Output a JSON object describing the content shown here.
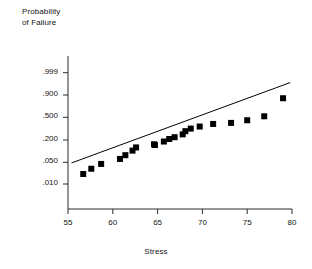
{
  "chart": {
    "type": "scatter",
    "title": "",
    "ylabel": "Probability\nof Failure",
    "xlabel": "Stress"
  },
  "chart_data": {
    "type": "scatter",
    "title": "",
    "xlabel": "Stress",
    "ylabel": "Probability of Failure",
    "y_scale": "probability",
    "grid": false,
    "legend": null,
    "xlim": [
      55,
      80
    ],
    "xticks": [
      55,
      60,
      65,
      70,
      75,
      80
    ],
    "xtick_labels": [
      "55",
      "60",
      "65",
      "70",
      "75",
      "80"
    ],
    "yticks": [
      0.01,
      0.05,
      0.2,
      0.5,
      0.9,
      0.999
    ],
    "ytick_labels": [
      ".010",
      ".050",
      ".200",
      ".500",
      ".900",
      ".999"
    ],
    "ylim": [
      0.004,
      0.9995
    ],
    "series": [
      {
        "name": "observations",
        "marker": "square",
        "color": "#000000",
        "points": [
          {
            "x": 56.7,
            "y": 0.011
          },
          {
            "x": 57.6,
            "y": 0.021
          },
          {
            "x": 58.7,
            "y": 0.036
          },
          {
            "x": 60.8,
            "y": 0.06
          },
          {
            "x": 61.4,
            "y": 0.085
          },
          {
            "x": 62.2,
            "y": 0.125
          },
          {
            "x": 62.6,
            "y": 0.16
          },
          {
            "x": 64.6,
            "y": 0.2
          },
          {
            "x": 64.7,
            "y": 0.19
          },
          {
            "x": 65.7,
            "y": 0.24
          },
          {
            "x": 66.3,
            "y": 0.28
          },
          {
            "x": 66.9,
            "y": 0.31
          },
          {
            "x": 67.8,
            "y": 0.36
          },
          {
            "x": 68.1,
            "y": 0.42
          },
          {
            "x": 68.7,
            "y": 0.47
          },
          {
            "x": 69.7,
            "y": 0.51
          },
          {
            "x": 71.2,
            "y": 0.56
          },
          {
            "x": 73.2,
            "y": 0.58
          },
          {
            "x": 75.0,
            "y": 0.63
          },
          {
            "x": 76.9,
            "y": 0.7
          },
          {
            "x": 79.0,
            "y": 0.92
          }
        ]
      },
      {
        "name": "fit-line",
        "type": "line",
        "color": "#000000",
        "endpoints": [
          {
            "x": 55.4,
            "y": 0.04
          },
          {
            "x": 79.8,
            "y": 0.985
          }
        ]
      }
    ]
  }
}
